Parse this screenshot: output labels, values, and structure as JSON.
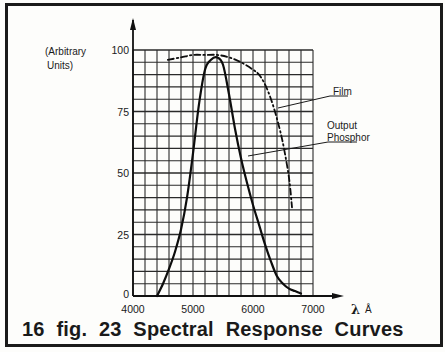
{
  "caption": "16 fig. 23  Spectral  Response  Curves",
  "ylabel_lines": [
    "(Arbitrary",
    "Units)"
  ],
  "xlabel": "λ Å",
  "labels": {
    "film": "Film",
    "phosphor_line1": "Output",
    "phosphor_line2": "Phosphor"
  },
  "chart_data": {
    "type": "line",
    "title": "Spectral Response Curves",
    "figure_label": "16 fig. 23",
    "xlabel": "λ Å",
    "ylabel": "(Arbitrary Units)",
    "xlim": [
      4000,
      7000
    ],
    "ylim": [
      0,
      100
    ],
    "xticks": [
      4000,
      5000,
      6000,
      7000
    ],
    "yticks": [
      0,
      25,
      50,
      75,
      100
    ],
    "grid": true,
    "grid_minor_x_step": 200,
    "grid_minor_y_step": 5,
    "series": [
      {
        "name": "Output Phosphor",
        "style": "solid",
        "x": [
          4400,
          4500,
          4600,
          4700,
          4800,
          4900,
          5000,
          5100,
          5200,
          5300,
          5400,
          5500,
          5600,
          5700,
          5800,
          5900,
          6000,
          6100,
          6200,
          6300,
          6400,
          6500,
          6600,
          6700,
          6800
        ],
        "values": [
          0,
          5,
          11,
          18,
          27,
          40,
          58,
          78,
          92,
          96,
          97,
          94,
          82,
          68,
          56,
          46,
          37,
          29,
          21,
          14,
          8,
          5,
          3,
          2,
          1
        ]
      },
      {
        "name": "Film",
        "style": "dash-dot",
        "x": [
          4580,
          4800,
          5000,
          5200,
          5400,
          5600,
          5800,
          6000,
          6100,
          6200,
          6300,
          6400,
          6500,
          6600,
          6650
        ],
        "values": [
          96,
          97,
          98,
          98,
          98,
          97,
          95,
          92,
          90,
          86,
          80,
          72,
          62,
          48,
          36
        ]
      }
    ],
    "annotations": [
      {
        "text": "Film",
        "points_to": "Film curve near 6300 Å"
      },
      {
        "text": "Output Phosphor",
        "points_to": "Output Phosphor curve near 5800 Å"
      }
    ]
  }
}
